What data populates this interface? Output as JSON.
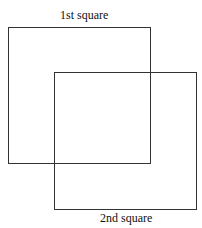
{
  "diagram": {
    "squares": [
      {
        "label": "1st square",
        "left": 8,
        "top": 27,
        "width": 143,
        "height": 137
      },
      {
        "label": "2nd square",
        "left": 54,
        "top": 72,
        "width": 143,
        "height": 138
      }
    ],
    "colors": {
      "stroke": "#333333",
      "text": "#111111",
      "background": "#ffffff"
    }
  }
}
